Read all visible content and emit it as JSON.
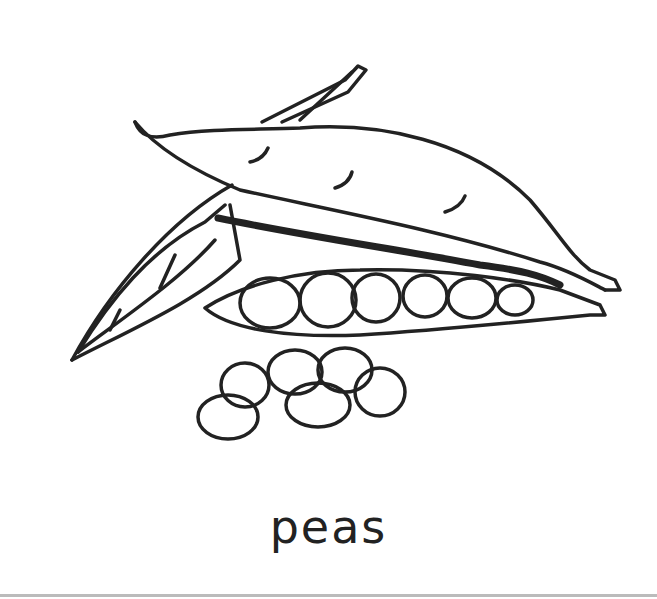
{
  "illustration": {
    "subject": "pea pods with loose peas",
    "caption": "peas",
    "stroke_color": "#222222",
    "background": "#ffffff",
    "loose_pea_count": 6,
    "peas_in_open_pod": 6
  }
}
